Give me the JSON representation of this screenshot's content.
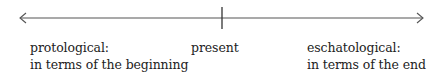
{
  "diagram": {
    "type": "timeline",
    "colors": {
      "line": "#555555",
      "text": "#222222",
      "background": "#ffffff"
    },
    "axis": {
      "direction": "bidirectional",
      "left_arrow_icon": "arrow-left-icon",
      "right_arrow_icon": "arrow-right-icon",
      "center_tick": "present-marker"
    },
    "labels": {
      "left": {
        "title": "protological:",
        "subtitle": "in terms of the beginning"
      },
      "center": {
        "title": "present"
      },
      "right": {
        "title": "eschatological:",
        "subtitle": "in terms of the end"
      }
    }
  }
}
